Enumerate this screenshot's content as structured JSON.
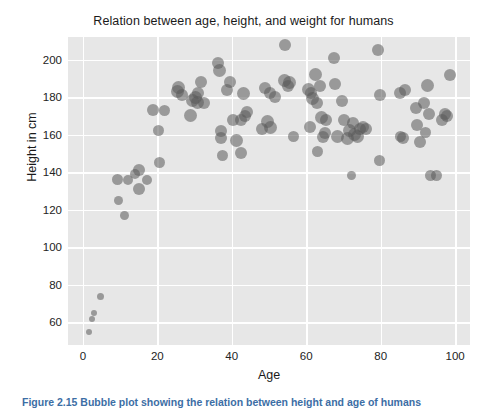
{
  "figure": {
    "caption": "Figure 2.15  Bubble plot showing the relation between height and age of humans"
  },
  "chart_data": {
    "type": "scatter",
    "variant": "bubble",
    "title": "Relation between age, height, and weight for humans",
    "xlabel": "Age",
    "ylabel": "Height in cm",
    "xlim": [
      -4,
      104
    ],
    "ylim": [
      48,
      212
    ],
    "xticks": [
      0,
      20,
      40,
      60,
      80,
      100
    ],
    "yticks": [
      60,
      80,
      100,
      120,
      140,
      160,
      180,
      200
    ],
    "grid": true,
    "legend": "none",
    "style": "darkgrid",
    "marker_color": "#5a5a5a",
    "marker_opacity": 0.55,
    "size_encodes": "weight",
    "axes_background": "#e7e7e7",
    "gridline_color": "#ffffff",
    "points": [
      {
        "x": 1.6,
        "y": 55,
        "s": 6
      },
      {
        "x": 2.4,
        "y": 62,
        "s": 6
      },
      {
        "x": 2.9,
        "y": 65,
        "s": 6
      },
      {
        "x": 4.6,
        "y": 74,
        "s": 7
      },
      {
        "x": 9.2,
        "y": 136,
        "s": 11
      },
      {
        "x": 9.6,
        "y": 125,
        "s": 9
      },
      {
        "x": 11.3,
        "y": 117,
        "s": 9
      },
      {
        "x": 12.0,
        "y": 136,
        "s": 10
      },
      {
        "x": 14.0,
        "y": 139,
        "s": 10
      },
      {
        "x": 15.2,
        "y": 141,
        "s": 12
      },
      {
        "x": 15.0,
        "y": 131,
        "s": 12
      },
      {
        "x": 17.3,
        "y": 136,
        "s": 10
      },
      {
        "x": 18.8,
        "y": 173,
        "s": 12
      },
      {
        "x": 20.6,
        "y": 145,
        "s": 11
      },
      {
        "x": 20.2,
        "y": 162,
        "s": 11
      },
      {
        "x": 21.8,
        "y": 173,
        "s": 11
      },
      {
        "x": 25.4,
        "y": 183,
        "s": 13
      },
      {
        "x": 25.8,
        "y": 185,
        "s": 13
      },
      {
        "x": 26.6,
        "y": 181,
        "s": 12
      },
      {
        "x": 29.4,
        "y": 178,
        "s": 13
      },
      {
        "x": 29.0,
        "y": 170,
        "s": 13
      },
      {
        "x": 30.3,
        "y": 180,
        "s": 13
      },
      {
        "x": 30.8,
        "y": 177,
        "s": 13
      },
      {
        "x": 31.0,
        "y": 182,
        "s": 12
      },
      {
        "x": 31.6,
        "y": 188,
        "s": 12
      },
      {
        "x": 32.6,
        "y": 177,
        "s": 12
      },
      {
        "x": 36.3,
        "y": 198,
        "s": 12
      },
      {
        "x": 36.6,
        "y": 194,
        "s": 13
      },
      {
        "x": 37.0,
        "y": 162,
        "s": 12
      },
      {
        "x": 37.2,
        "y": 158,
        "s": 12
      },
      {
        "x": 37.6,
        "y": 149,
        "s": 11
      },
      {
        "x": 38.8,
        "y": 184,
        "s": 12
      },
      {
        "x": 39.6,
        "y": 188,
        "s": 12
      },
      {
        "x": 40.4,
        "y": 168,
        "s": 12
      },
      {
        "x": 41.4,
        "y": 157,
        "s": 13
      },
      {
        "x": 42.6,
        "y": 168,
        "s": 12
      },
      {
        "x": 42.4,
        "y": 150,
        "s": 12
      },
      {
        "x": 43.2,
        "y": 182,
        "s": 13
      },
      {
        "x": 43.5,
        "y": 170,
        "s": 12
      },
      {
        "x": 44.2,
        "y": 172,
        "s": 12
      },
      {
        "x": 48.0,
        "y": 163,
        "s": 12
      },
      {
        "x": 48.8,
        "y": 185,
        "s": 12
      },
      {
        "x": 49.6,
        "y": 167,
        "s": 13
      },
      {
        "x": 50.2,
        "y": 182,
        "s": 12
      },
      {
        "x": 50.4,
        "y": 164,
        "s": 13
      },
      {
        "x": 51.6,
        "y": 180,
        "s": 12
      },
      {
        "x": 54.4,
        "y": 208,
        "s": 12
      },
      {
        "x": 54.2,
        "y": 189,
        "s": 13
      },
      {
        "x": 55.4,
        "y": 188,
        "s": 13
      },
      {
        "x": 55.0,
        "y": 186,
        "s": 12
      },
      {
        "x": 56.6,
        "y": 159,
        "s": 11
      },
      {
        "x": 60.6,
        "y": 184,
        "s": 13
      },
      {
        "x": 61.2,
        "y": 182,
        "s": 12
      },
      {
        "x": 61.6,
        "y": 179,
        "s": 13
      },
      {
        "x": 61.0,
        "y": 164,
        "s": 12
      },
      {
        "x": 62.4,
        "y": 192,
        "s": 13
      },
      {
        "x": 62.8,
        "y": 177,
        "s": 12
      },
      {
        "x": 63.0,
        "y": 151,
        "s": 11
      },
      {
        "x": 63.8,
        "y": 186,
        "s": 12
      },
      {
        "x": 64.2,
        "y": 169,
        "s": 13
      },
      {
        "x": 64.6,
        "y": 159,
        "s": 12
      },
      {
        "x": 65.0,
        "y": 161,
        "s": 12
      },
      {
        "x": 65.4,
        "y": 168,
        "s": 12
      },
      {
        "x": 67.4,
        "y": 201,
        "s": 12
      },
      {
        "x": 67.8,
        "y": 187,
        "s": 12
      },
      {
        "x": 68.4,
        "y": 159,
        "s": 13
      },
      {
        "x": 69.6,
        "y": 178,
        "s": 12
      },
      {
        "x": 70.2,
        "y": 168,
        "s": 12
      },
      {
        "x": 71.0,
        "y": 158,
        "s": 13
      },
      {
        "x": 71.6,
        "y": 162,
        "s": 13
      },
      {
        "x": 72.2,
        "y": 138,
        "s": 9
      },
      {
        "x": 72.6,
        "y": 166,
        "s": 12
      },
      {
        "x": 73.0,
        "y": 160,
        "s": 13
      },
      {
        "x": 73.8,
        "y": 159,
        "s": 13
      },
      {
        "x": 74.4,
        "y": 163,
        "s": 12
      },
      {
        "x": 75.2,
        "y": 164,
        "s": 12
      },
      {
        "x": 76.0,
        "y": 163,
        "s": 12
      },
      {
        "x": 79.4,
        "y": 205,
        "s": 12
      },
      {
        "x": 79.8,
        "y": 181,
        "s": 12
      },
      {
        "x": 79.6,
        "y": 146,
        "s": 11
      },
      {
        "x": 85.2,
        "y": 182,
        "s": 12
      },
      {
        "x": 85.4,
        "y": 159,
        "s": 11
      },
      {
        "x": 86.0,
        "y": 158,
        "s": 12
      },
      {
        "x": 86.6,
        "y": 184,
        "s": 12
      },
      {
        "x": 89.4,
        "y": 174,
        "s": 12
      },
      {
        "x": 89.8,
        "y": 165,
        "s": 12
      },
      {
        "x": 90.6,
        "y": 156,
        "s": 12
      },
      {
        "x": 91.6,
        "y": 177,
        "s": 12
      },
      {
        "x": 92.0,
        "y": 161,
        "s": 11
      },
      {
        "x": 92.6,
        "y": 186,
        "s": 13
      },
      {
        "x": 93.0,
        "y": 171,
        "s": 12
      },
      {
        "x": 93.4,
        "y": 138,
        "s": 11
      },
      {
        "x": 95.0,
        "y": 138,
        "s": 11
      },
      {
        "x": 96.4,
        "y": 168,
        "s": 12
      },
      {
        "x": 97.2,
        "y": 171,
        "s": 12
      },
      {
        "x": 97.8,
        "y": 170,
        "s": 12
      },
      {
        "x": 98.6,
        "y": 192,
        "s": 12
      }
    ]
  }
}
